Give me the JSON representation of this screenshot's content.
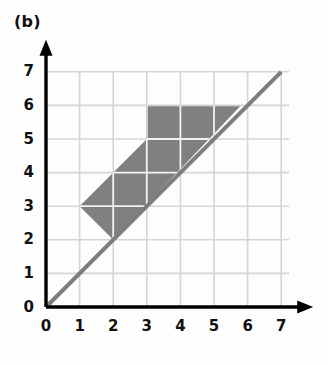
{
  "panel": {
    "label": "(b)"
  },
  "chart_data": {
    "type": "scatter",
    "title": "(b)",
    "xlabel": "",
    "ylabel": "",
    "xlim": [
      0,
      7
    ],
    "ylim": [
      0,
      7
    ],
    "xticks": [
      "0",
      "1",
      "2",
      "3",
      "4",
      "5",
      "6",
      "7"
    ],
    "yticks": [
      "0",
      "1",
      "2",
      "3",
      "4",
      "5",
      "6",
      "7"
    ],
    "xtick_values": [
      0,
      1,
      2,
      3,
      4,
      5,
      6,
      7
    ],
    "ytick_values": [
      0,
      1,
      2,
      3,
      4,
      5,
      6,
      7
    ],
    "grid": true,
    "grid_spacing": 1,
    "legend": null,
    "series": [
      {
        "name": "line y = x",
        "type": "line",
        "x": [
          0,
          7
        ],
        "y": [
          0,
          7
        ],
        "color": "#7d7d7d",
        "width": 4
      },
      {
        "name": "shaded region",
        "type": "polygon",
        "points": [
          [
            1,
            3
          ],
          [
            3,
            5
          ],
          [
            3,
            6
          ],
          [
            5.8,
            6
          ],
          [
            2,
            2
          ]
        ],
        "color": "#808080"
      }
    ],
    "axes": {
      "x_arrow": true,
      "y_arrow": true,
      "color": "#000000"
    }
  },
  "colors": {
    "fill": "#808080",
    "grid": "#d5d5d5",
    "diagonal": "#7d7d7d",
    "axis": "#000000",
    "text": "#111111",
    "background": "#fdfdfd"
  }
}
